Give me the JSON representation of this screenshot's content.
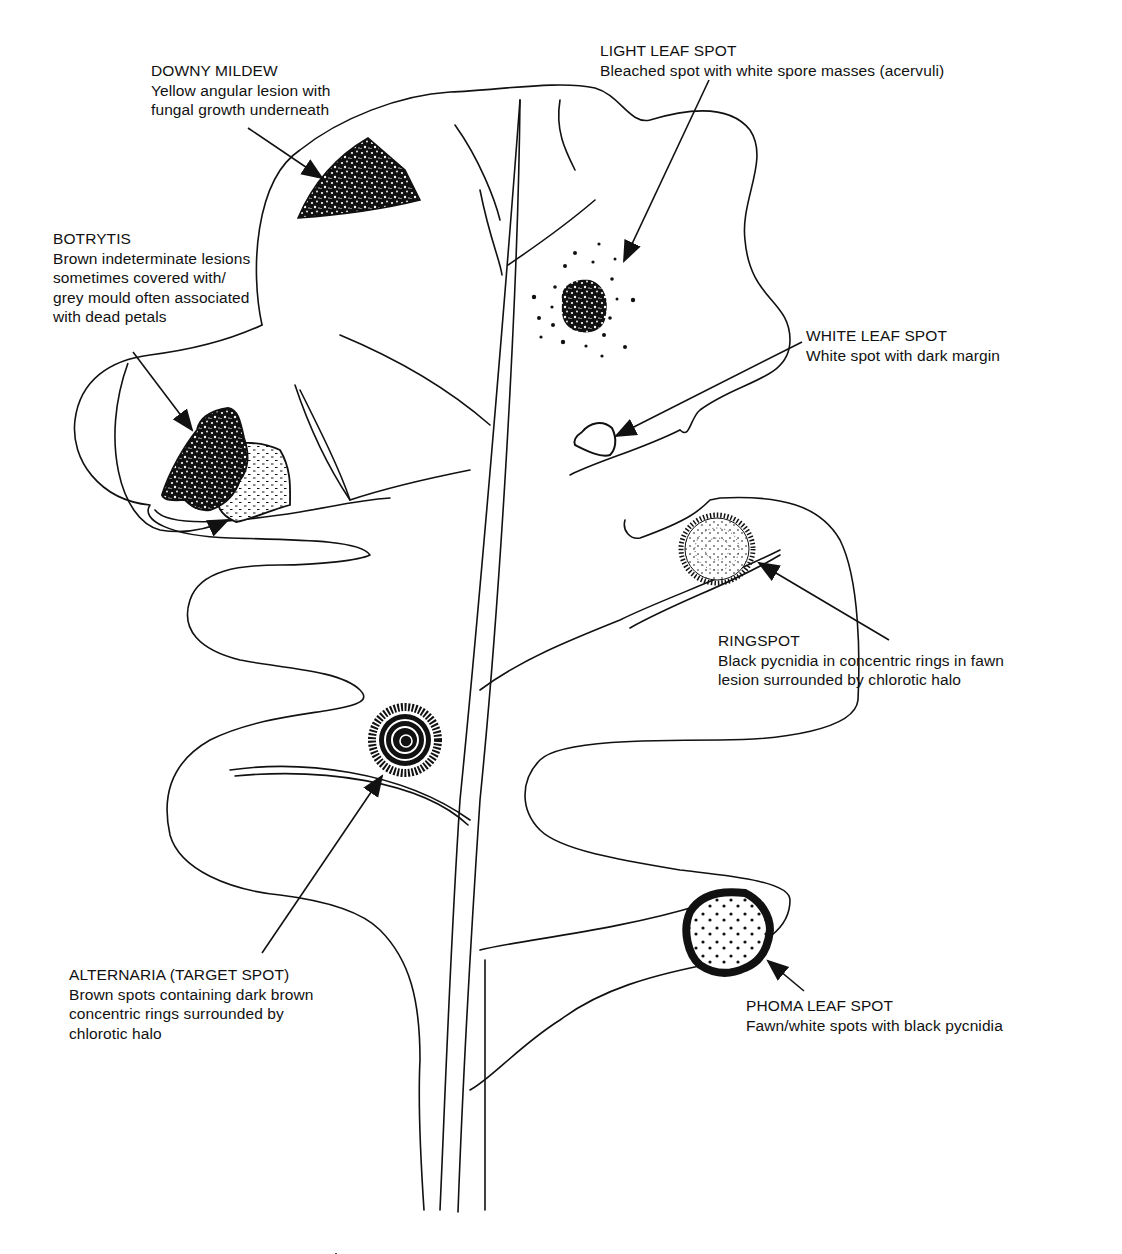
{
  "diagram": {
    "colors": {
      "ink": "#111111",
      "background": "#ffffff"
    },
    "labels": [
      {
        "id": "downy-mildew",
        "title": "DOWNY MILDEW",
        "lines": [
          "Yellow angular lesion with",
          "fungal growth underneath"
        ],
        "x": 151,
        "y": 61
      },
      {
        "id": "light-leaf-spot",
        "title": "LIGHT LEAF SPOT",
        "lines": [
          "Bleached spot with white spore masses (acervuli)"
        ],
        "x": 600,
        "y": 41
      },
      {
        "id": "botrytis",
        "title": "BOTRYTIS",
        "lines": [
          "Brown indeterminate lesions",
          "sometimes covered with/",
          "grey mould often associated",
          "with dead petals"
        ],
        "x": 53,
        "y": 229
      },
      {
        "id": "white-leaf-spot",
        "title": "WHITE LEAF SPOT",
        "lines": [
          "White spot with dark margin"
        ],
        "x": 806,
        "y": 326
      },
      {
        "id": "ringspot",
        "title": "RINGSPOT",
        "lines": [
          "Black pycnidia in concentric rings in fawn",
          "lesion surrounded by chlorotic halo"
        ],
        "x": 718,
        "y": 631
      },
      {
        "id": "alternaria",
        "title": "ALTERNARIA (TARGET SPOT)",
        "lines": [
          "Brown spots containing dark brown",
          "concentric rings  surrounded by",
          "chlorotic halo"
        ],
        "x": 69,
        "y": 965
      },
      {
        "id": "phoma-leaf-spot",
        "title": "PHOMA LEAF SPOT",
        "lines": [
          "Fawn/white spots with black pycnidia"
        ],
        "x": 746,
        "y": 996
      }
    ]
  }
}
